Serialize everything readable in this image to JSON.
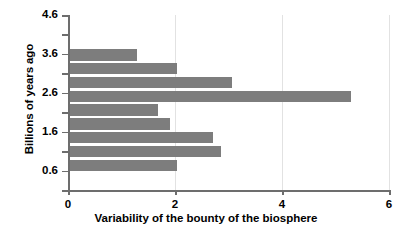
{
  "chart_data": {
    "type": "bar",
    "orientation": "horizontal",
    "title": "",
    "xlabel": "Variability of the bounty of the biosphere",
    "ylabel": "Billions of years ago",
    "xlim": [
      0,
      6
    ],
    "ylim": [
      0.1,
      4.6
    ],
    "xticks": [
      0,
      2,
      4,
      6
    ],
    "xtick_labels": [
      "0",
      "2",
      "4",
      "6"
    ],
    "yticks": [
      4.6,
      3.6,
      2.6,
      1.6,
      0.6
    ],
    "ytick_labels": [
      "4.6",
      "3.6",
      "2.6",
      "1.6",
      "0.6"
    ],
    "yminor_ticks": [
      4.1,
      3.1,
      2.1,
      1.1,
      0.1
    ],
    "grid": "vertical-only",
    "legend": "none",
    "bar_color": "#7d7d7d",
    "axis_color": "#6d6d6d",
    "categories": [
      3.6,
      3.1,
      2.6,
      2.1,
      1.6,
      1.1,
      0.6,
      0.35,
      0.1
    ],
    "values": [
      1.27,
      2.0,
      3.03,
      5.27,
      1.65,
      1.87,
      2.69,
      2.84,
      2.0
    ],
    "bars": [
      {
        "category": "3.6",
        "value": 1.27
      },
      {
        "category": "3.1",
        "value": 2.0
      },
      {
        "category": "2.6",
        "value": 3.03
      },
      {
        "category": "2.1",
        "value": 5.27
      },
      {
        "category": "1.6",
        "value": 1.65
      },
      {
        "category": "1.1",
        "value": 1.87
      },
      {
        "category": "0.6",
        "value": 2.69
      },
      {
        "category": "0.35",
        "value": 2.84
      },
      {
        "category": "0.1",
        "value": 2.0
      }
    ]
  }
}
